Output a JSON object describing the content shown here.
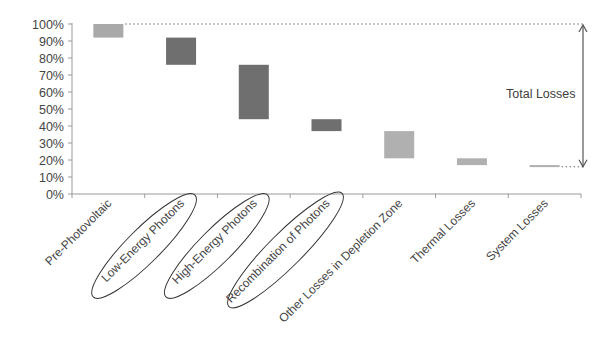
{
  "chart_data": {
    "type": "bar",
    "subtype": "waterfall",
    "title": "",
    "xlabel": "",
    "ylabel": "",
    "ylim": [
      0,
      100
    ],
    "yticks": [
      "0%",
      "10%",
      "20%",
      "30%",
      "40%",
      "50%",
      "60%",
      "70%",
      "80%",
      "90%",
      "100%"
    ],
    "grid": false,
    "legend": null,
    "categories": [
      "Pre-Photovoltaic",
      "Low-Energy Photons",
      "High-Energy Photons",
      "Recombination of Photons",
      "Other Losses in Depletion Zone",
      "Thermal Losses",
      "System Losses"
    ],
    "series": [
      {
        "name": "Loss range",
        "bar_top": [
          100,
          92,
          76,
          44,
          37,
          21,
          17
        ],
        "bar_bottom": [
          92,
          76,
          44,
          37,
          21,
          17,
          16
        ],
        "values": [
          8,
          16,
          32,
          7,
          16,
          4,
          1
        ],
        "colors": [
          "#a9a9a9",
          "#6f6f6f",
          "#6f6f6f",
          "#6f6f6f",
          "#b0b0b0",
          "#b0b0b0",
          "#b0b0b0"
        ]
      }
    ],
    "highlighted_categories": [
      "Low-Energy Photons",
      "High-Energy Photons",
      "Recombination of Photons"
    ],
    "annotations": [
      {
        "text": "Total Losses",
        "type": "double-arrow",
        "from": 100,
        "to": 16
      }
    ]
  },
  "colors": {
    "axis": "#9a9a9a",
    "text": "#444444",
    "ellipse": "#333333",
    "arrow": "#555555",
    "dotted": "#666666"
  }
}
